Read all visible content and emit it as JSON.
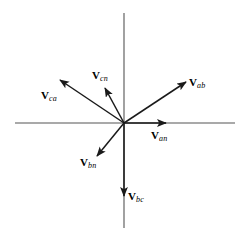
{
  "figure": {
    "kind": "phasor-diagram",
    "title": "",
    "width": 245,
    "height": 240,
    "background_color": "#ffffff",
    "line_color": "#404040",
    "vector_color": "#1a1a1a",
    "text_color": "#000000"
  },
  "axes": {
    "origin": {
      "x": 124,
      "y": 123
    },
    "x_axis": {
      "x1": 15,
      "y1": 123,
      "x2": 235,
      "y2": 123
    },
    "y_axis": {
      "x1": 124,
      "y1": 13,
      "x2": 124,
      "y2": 228
    }
  },
  "chart_data": {
    "type": "scatter",
    "title": "",
    "xlabel": "",
    "ylabel": "",
    "grid": false,
    "legend": "none",
    "origin": {
      "x": 124,
      "y": 123
    },
    "vectors": [
      {
        "name": "V_ab",
        "symbol": "V",
        "subscript": "ab",
        "tip": {
          "x": 186,
          "y": 82
        },
        "angle_deg": 33,
        "length_px": 74,
        "label_pos": {
          "x": 189,
          "y": 73
        }
      },
      {
        "name": "V_an",
        "symbol": "V",
        "subscript": "an",
        "tip": {
          "x": 166,
          "y": 123
        },
        "angle_deg": 0,
        "length_px": 42,
        "label_pos": {
          "x": 151,
          "y": 126
        }
      },
      {
        "name": "V_cn",
        "symbol": "V",
        "subscript": "cn",
        "tip": {
          "x": 105,
          "y": 88
        },
        "angle_deg": 119,
        "length_px": 40,
        "label_pos": {
          "x": 92,
          "y": 66
        }
      },
      {
        "name": "V_ca",
        "symbol": "V",
        "subscript": "ca",
        "tip": {
          "x": 60,
          "y": 80
        },
        "angle_deg": 147,
        "length_px": 76,
        "label_pos": {
          "x": 41,
          "y": 86
        }
      },
      {
        "name": "V_bn",
        "symbol": "V",
        "subscript": "bn",
        "tip": {
          "x": 97,
          "y": 156
        },
        "angle_deg": -51,
        "length_px": 42,
        "label_pos": {
          "x": 80,
          "y": 153
        }
      },
      {
        "name": "V_bc",
        "symbol": "V",
        "subscript": "bc",
        "tip": {
          "x": 124,
          "y": 196
        },
        "angle_deg": -90,
        "length_px": 73,
        "label_pos": {
          "x": 128,
          "y": 187
        }
      }
    ]
  }
}
